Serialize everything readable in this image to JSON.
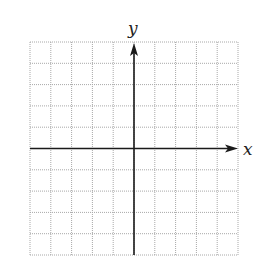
{
  "diagram": {
    "type": "coordinate-grid",
    "grid": {
      "columns": 10,
      "rows": 10,
      "left": 30,
      "top": 42,
      "right": 238,
      "bottom": 255,
      "line_color": "#a8a8a8",
      "line_style": "dotted"
    },
    "axes": {
      "color": "#1a1a1a",
      "x_axis": {
        "label": "x",
        "row_index": 5,
        "arrow_end_x": 238
      },
      "y_axis": {
        "label": "y",
        "column_index": 5,
        "arrow_end_y": 43
      }
    }
  }
}
